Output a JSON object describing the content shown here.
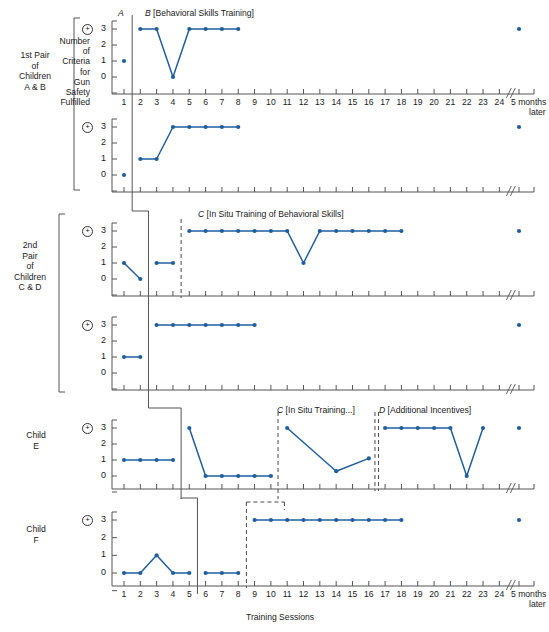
{
  "figure": {
    "x_axis_title": "Training Sessions",
    "y_axis_title": "Number of Criteria for Gun Safety Fulfilled",
    "y_axis_title_lines": [
      "Number",
      "of",
      "Criteria",
      "for",
      "Gun",
      "Safety",
      "Fulfilled"
    ],
    "y_ticks": [
      "3",
      "2",
      "1",
      "0"
    ],
    "plus_symbol": "+",
    "x_tick_labels": [
      "1",
      "2",
      "3",
      "4",
      "5",
      "6",
      "7",
      "8",
      "9",
      "10",
      "11",
      "12",
      "13",
      "14",
      "15",
      "16",
      "17",
      "18",
      "19",
      "20",
      "21",
      "22",
      "23",
      "24"
    ],
    "followup_label_line1": "5 months",
    "followup_label_line2": "later",
    "axis_break_symbol": "//",
    "series_color": "#1f5fa0",
    "axis_color": "#555555"
  },
  "group_labels": [
    {
      "name": "group-1st-pair",
      "lines": [
        "1st Pair",
        "of",
        "Children",
        "A & B"
      ]
    },
    {
      "name": "group-2nd-pair",
      "lines": [
        "2nd",
        "Pair",
        "of",
        "Children",
        "C & D"
      ]
    },
    {
      "name": "group-child-e",
      "lines": [
        "Child",
        "E"
      ]
    },
    {
      "name": "group-child-f",
      "lines": [
        "Child",
        "F"
      ]
    }
  ],
  "phase_labels": [
    {
      "panel": 0,
      "letter": "A",
      "text": "",
      "session": 1
    },
    {
      "panel": 0,
      "letter": "B",
      "text": "[Behavioral Skills Training]",
      "session": 2
    },
    {
      "panel": 2,
      "letter": "C",
      "text": "[In Situ Training of Behavioral Skills]",
      "session": 5
    },
    {
      "panel": 4,
      "letter": "C",
      "text": "[In Situ Training...]",
      "session": 11
    },
    {
      "panel": 4,
      "letter": "D",
      "text": "[Additional Incentives]",
      "session": 17
    }
  ],
  "chart_data": {
    "type": "line",
    "xlabel": "Training Sessions",
    "ylabel": "Number of Criteria for Gun Safety Fulfilled",
    "ylim": [
      0,
      3
    ],
    "xlim": [
      1,
      24
    ],
    "grid": false,
    "legend": false,
    "followup_x_label": "5 months later",
    "panels": [
      {
        "name": "child-a",
        "group": "1st Pair of Children A & B",
        "phases": [
          {
            "label": "A",
            "name": "baseline",
            "x": [
              1
            ],
            "y": [
              1
            ]
          },
          {
            "label": "B",
            "name": "Behavioral Skills Training",
            "x": [
              2,
              3,
              4,
              5,
              6,
              7,
              8
            ],
            "y": [
              3,
              3,
              0,
              3,
              3,
              3,
              3
            ]
          }
        ],
        "followup": {
          "x_label": "5 months later",
          "y": 3
        }
      },
      {
        "name": "child-b",
        "group": "1st Pair of Children A & B",
        "phases": [
          {
            "label": "A",
            "name": "baseline",
            "x": [
              1
            ],
            "y": [
              0
            ]
          },
          {
            "label": "B",
            "name": "Behavioral Skills Training",
            "x": [
              2,
              3,
              4,
              5,
              6,
              7,
              8
            ],
            "y": [
              1,
              1,
              3,
              3,
              3,
              3,
              3
            ]
          }
        ],
        "followup": {
          "x_label": "5 months later",
          "y": 3
        }
      },
      {
        "name": "child-c",
        "group": "2nd Pair of Children C & D",
        "phases": [
          {
            "label": "A",
            "name": "baseline",
            "x": [
              1,
              2
            ],
            "y": [
              1,
              0
            ]
          },
          {
            "label": "B",
            "name": "Behavioral Skills Training",
            "x": [
              3,
              4
            ],
            "y": [
              1,
              1
            ]
          },
          {
            "label": "C",
            "name": "In Situ Training of Behavioral Skills",
            "x": [
              5,
              6,
              7,
              8,
              9,
              10,
              11,
              12,
              13,
              14,
              15,
              16,
              17,
              18
            ],
            "y": [
              3,
              3,
              3,
              3,
              3,
              3,
              3,
              1,
              3,
              3,
              3,
              3,
              3,
              3
            ]
          }
        ],
        "followup": {
          "x_label": "5 months later",
          "y": 3
        }
      },
      {
        "name": "child-d",
        "group": "2nd Pair of Children C & D",
        "phases": [
          {
            "label": "A",
            "name": "baseline",
            "x": [
              1,
              2
            ],
            "y": [
              1,
              1
            ]
          },
          {
            "label": "B",
            "name": "Behavioral Skills Training",
            "x": [
              3,
              4,
              5,
              6,
              7,
              8,
              9
            ],
            "y": [
              3,
              3,
              3,
              3,
              3,
              3,
              3
            ]
          }
        ],
        "followup": {
          "x_label": "5 months later",
          "y": 3
        }
      },
      {
        "name": "child-e",
        "group": "Child E",
        "phases": [
          {
            "label": "A",
            "name": "baseline",
            "x": [
              1,
              2,
              3,
              4
            ],
            "y": [
              1,
              1,
              1,
              1
            ]
          },
          {
            "label": "B",
            "name": "Behavioral Skills Training",
            "x": [
              5,
              6,
              7,
              8,
              9,
              10
            ],
            "y": [
              3,
              0,
              0,
              0,
              0,
              0
            ]
          },
          {
            "label": "C",
            "name": "In Situ Training...",
            "x": [
              11,
              14,
              16
            ],
            "y": [
              3,
              0.3,
              1.1
            ]
          },
          {
            "label": "D",
            "name": "Additional Incentives",
            "x": [
              17,
              18,
              19,
              20,
              21,
              22,
              23
            ],
            "y": [
              3,
              3,
              3,
              3,
              3,
              0,
              3
            ]
          }
        ],
        "followup": {
          "x_label": "5 months later",
          "y": 3
        }
      },
      {
        "name": "child-f",
        "group": "Child F",
        "phases": [
          {
            "label": "A",
            "name": "baseline",
            "x": [
              1,
              2,
              3,
              4,
              5
            ],
            "y": [
              0,
              0,
              1,
              0,
              0
            ]
          },
          {
            "label": "B",
            "name": "Behavioral Skills Training",
            "x": [
              6,
              7,
              8
            ],
            "y": [
              0,
              0,
              0
            ]
          },
          {
            "label": "C",
            "name": "In Situ Training",
            "x": [
              9,
              10,
              11,
              12,
              13,
              14,
              15,
              16,
              17,
              18
            ],
            "y": [
              3,
              3,
              3,
              3,
              3,
              3,
              3,
              3,
              3,
              3
            ]
          }
        ],
        "followup": {
          "x_label": "5 months later",
          "y": 3
        }
      }
    ]
  }
}
